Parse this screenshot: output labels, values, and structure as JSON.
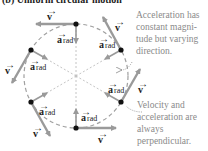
{
  "title": "(b) Uniform circular motion",
  "annotations": {
    "top": "Acceleration has constant magni-tude but varying direction.",
    "bottom": "Velocity and acceleration are always perpendicular."
  },
  "labels": {
    "velocity": "v",
    "acceleration": "a",
    "acceleration_subscript": "rad"
  },
  "colors": {
    "arrow": "#9a9a9a",
    "dot": "#111111",
    "circle": "#a0a0a0",
    "annotation_text": "#8a8a8a"
  },
  "diagram": {
    "center": [
      76,
      76
    ],
    "radius": 52,
    "points": [
      {
        "name": "top",
        "angle_deg": 90
      },
      {
        "name": "upper-right",
        "angle_deg": 30
      },
      {
        "name": "lower-right",
        "angle_deg": -30
      },
      {
        "name": "bottom",
        "angle_deg": -90
      },
      {
        "name": "lower-left",
        "angle_deg": -150
      },
      {
        "name": "upper-left",
        "angle_deg": 150
      }
    ]
  }
}
